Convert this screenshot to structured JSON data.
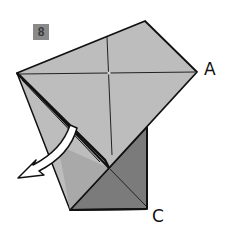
{
  "step": {
    "number": "8"
  },
  "labels": {
    "corner_a": "A",
    "corner_c": "C"
  },
  "colors": {
    "paper_light": "#bdbdbd",
    "paper_dark": "#7b7b7b",
    "outline": "#111111",
    "badge": "#8a8a8a",
    "arrow_fill": "#ffffff"
  },
  "diagram": {
    "arrow": {
      "direction": "down-left",
      "type": "fold-arrow"
    }
  }
}
